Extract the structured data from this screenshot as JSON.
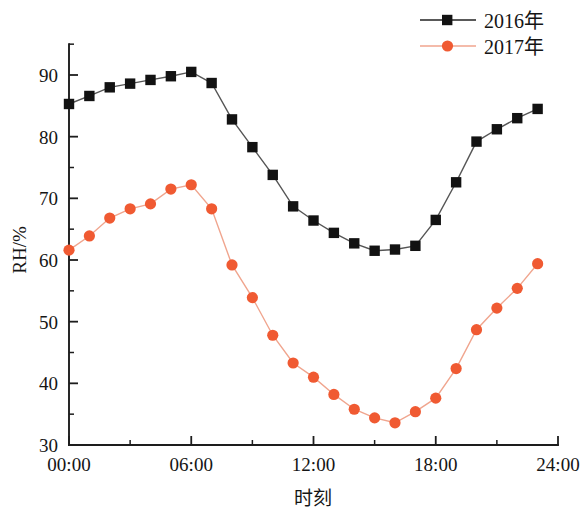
{
  "chart_data": {
    "type": "line",
    "title": "",
    "xlabel": "时刻",
    "ylabel": "RH/%",
    "xlim": [
      0,
      24
    ],
    "ylim": [
      30,
      95
    ],
    "x_tick_labels": [
      "00:00",
      "06:00",
      "12:00",
      "18:00",
      "24:00"
    ],
    "x_tick_values": [
      0,
      6,
      12,
      18,
      24
    ],
    "x_minor_tick_values": [
      3,
      9,
      15,
      21
    ],
    "y_tick_labels": [
      "30",
      "40",
      "50",
      "60",
      "70",
      "80",
      "90"
    ],
    "y_tick_values": [
      30,
      40,
      50,
      60,
      70,
      80,
      90
    ],
    "y_minor_tick_values": [
      35,
      45,
      55,
      65,
      75,
      85,
      95
    ],
    "grid": false,
    "legend_position": "top-right",
    "x": [
      0,
      1,
      2,
      3,
      4,
      5,
      6,
      7,
      8,
      9,
      10,
      11,
      12,
      13,
      14,
      15,
      16,
      17,
      18,
      19,
      20,
      21,
      22,
      23
    ],
    "series": [
      {
        "name": "2016年",
        "color": "#121212",
        "line_color": "#555555",
        "marker": "square",
        "values": [
          85.3,
          86.6,
          88.0,
          88.6,
          89.2,
          89.8,
          90.5,
          88.7,
          82.8,
          78.3,
          73.8,
          68.7,
          66.4,
          64.4,
          62.7,
          61.5,
          61.7,
          62.3,
          66.5,
          72.6,
          79.2,
          81.2,
          83.0,
          84.5
        ]
      },
      {
        "name": "2017年",
        "color": "#f05a32",
        "line_color": "#f0a58e",
        "marker": "circle",
        "values": [
          61.6,
          63.9,
          66.8,
          68.3,
          69.1,
          71.5,
          72.2,
          68.3,
          59.2,
          53.9,
          47.8,
          43.3,
          41.0,
          38.2,
          35.8,
          34.4,
          33.6,
          35.4,
          37.6,
          42.4,
          48.7,
          52.2,
          55.4,
          59.4
        ]
      }
    ]
  },
  "legend": {
    "entries": [
      {
        "label": "2016年"
      },
      {
        "label": "2017年"
      }
    ]
  },
  "axes": {
    "y_title": "RH/%",
    "x_title": "时刻"
  }
}
